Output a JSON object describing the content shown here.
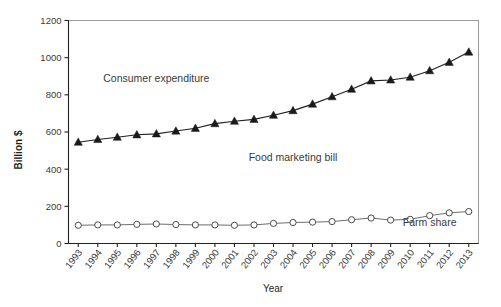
{
  "chart_data": {
    "type": "line",
    "title": "",
    "xlabel": "Year",
    "ylabel": "Billion $",
    "ylim": [
      0,
      1200
    ],
    "yticks": [
      0,
      200,
      400,
      600,
      800,
      1000,
      1200
    ],
    "ytick_labels": [
      "0",
      "200",
      "400",
      "600",
      "800",
      "1000",
      "1200"
    ],
    "grid": false,
    "legend_position": "inline-annotations",
    "categories": [
      "1993",
      "1994",
      "1995",
      "1996",
      "1997",
      "1998",
      "1999",
      "2000",
      "2001",
      "2002",
      "2003",
      "2004",
      "2005",
      "2006",
      "2007",
      "2008",
      "2009",
      "2010",
      "2011",
      "2012",
      "2013"
    ],
    "series": [
      {
        "name": "Consumer expenditure",
        "marker": "triangle",
        "values": [
          545,
          560,
          572,
          585,
          590,
          605,
          620,
          645,
          658,
          668,
          690,
          715,
          750,
          790,
          830,
          875,
          880,
          895,
          930,
          975,
          1030
        ]
      },
      {
        "name": "Farm share",
        "marker": "circle",
        "values": [
          98,
          100,
          100,
          103,
          105,
          102,
          100,
          100,
          98,
          100,
          108,
          113,
          115,
          118,
          128,
          137,
          126,
          130,
          150,
          165,
          172
        ]
      }
    ],
    "annotations": [
      {
        "text": "Consumer expenditure",
        "x_year": "1997",
        "y_value": 870
      },
      {
        "text": "Food marketing bill",
        "x_year": "2004",
        "y_value": 445
      },
      {
        "text": "Farm share",
        "x_year": "2011",
        "y_value": 92
      }
    ]
  },
  "axes": {
    "y_title": "Billion $",
    "x_title": "Year"
  }
}
